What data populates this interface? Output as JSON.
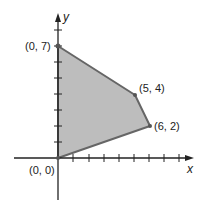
{
  "diagram": {
    "type": "feasible-region",
    "axes": {
      "x_label": "x",
      "y_label": "y",
      "x_ticks": 8,
      "y_ticks": 8
    },
    "colors": {
      "fill": "#bdbdbd",
      "edge": "#666666",
      "axis": "#222222"
    },
    "vertices": [
      {
        "label": "(0, 0)",
        "x": 0,
        "y": 0
      },
      {
        "label": "(0, 7)",
        "x": 0,
        "y": 7
      },
      {
        "label": "(5, 4)",
        "x": 5,
        "y": 4
      },
      {
        "label": "(6, 2)",
        "x": 6,
        "y": 2
      }
    ]
  }
}
